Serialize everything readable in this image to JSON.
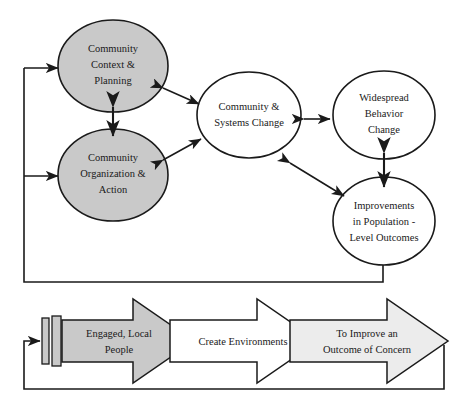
{
  "diagram": {
    "colors": {
      "shaded_circle_fill": "#c9c9c9",
      "plain_circle_fill": "#ffffff",
      "arrow_gray_fill": "#c9c9c9",
      "arrow_white_fill": "#ffffff",
      "arrow_light_fill": "#ececec",
      "stroke": "#1a1a1a",
      "text": "#1a1a1a"
    },
    "circles": [
      {
        "id": "community-context-planning",
        "lines": [
          "Community",
          "Context &",
          "Planning"
        ],
        "style": "shaded"
      },
      {
        "id": "community-organization-action",
        "lines": [
          "Community",
          "Organization &",
          "Action"
        ],
        "style": "shaded"
      },
      {
        "id": "community-systems-change",
        "lines": [
          "Community &",
          "Systems Change"
        ],
        "style": "plain"
      },
      {
        "id": "widespread-behavior-change",
        "lines": [
          "Widespread",
          "Behavior",
          "Change"
        ],
        "style": "plain"
      },
      {
        "id": "improvements-population-level-outcomes",
        "lines": [
          "Improvements",
          "in Population -",
          "Level Outcomes"
        ],
        "style": "plain"
      }
    ],
    "block_arrows": [
      {
        "id": "engaged-local-people",
        "lines": [
          "Engaged, Local",
          "People"
        ],
        "fill": "gray"
      },
      {
        "id": "create-environments",
        "lines": [
          "Create Environments"
        ],
        "fill": "white"
      },
      {
        "id": "to-improve-outcome-of-concern",
        "lines": [
          "To Improve an",
          "Outcome of Concern"
        ],
        "fill": "light"
      }
    ],
    "connectors": [
      {
        "id": "context-to-systems",
        "type": "double-arrow"
      },
      {
        "id": "organization-to-systems",
        "type": "double-arrow"
      },
      {
        "id": "context-to-organization",
        "type": "double-arrow-vertical"
      },
      {
        "id": "systems-to-behavior",
        "type": "double-arrow-horizontal"
      },
      {
        "id": "systems-to-improvements",
        "type": "double-arrow"
      },
      {
        "id": "behavior-to-improvements",
        "type": "double-arrow-vertical"
      },
      {
        "id": "outcomes-feedback-to-context",
        "type": "feedback-line-arrow"
      },
      {
        "id": "outcomes-feedback-to-organization",
        "type": "feedback-line-arrow"
      },
      {
        "id": "bottom-feedback-loop",
        "type": "feedback-line-arrow"
      }
    ]
  }
}
